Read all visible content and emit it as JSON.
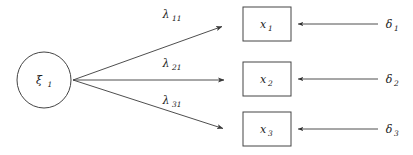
{
  "diagram": {
    "type": "sem-path-diagram",
    "background_color": "#ffffff",
    "stroke_color": "#3a3a3a",
    "text_color": "#1a1a1a",
    "latent_variables": [
      {
        "id": "xi1",
        "symbol": "ξ",
        "subscript": "1",
        "shape": "ellipse",
        "cx": 44,
        "cy": 80,
        "rx": 27,
        "ry": 28
      }
    ],
    "observed_variables": [
      {
        "id": "x1",
        "symbol": "x",
        "subscript": "1",
        "shape": "rectangle",
        "x": 243,
        "y": 7,
        "width": 48,
        "height": 34
      },
      {
        "id": "x2",
        "symbol": "x",
        "subscript": "2",
        "shape": "rectangle",
        "x": 243,
        "y": 62,
        "width": 48,
        "height": 34
      },
      {
        "id": "x3",
        "symbol": "x",
        "subscript": "3",
        "shape": "rectangle",
        "x": 243,
        "y": 112,
        "width": 48,
        "height": 34
      }
    ],
    "error_terms": [
      {
        "id": "delta1",
        "symbol": "δ",
        "subscript": "1",
        "x": 388,
        "y": 24
      },
      {
        "id": "delta2",
        "symbol": "δ",
        "subscript": "2",
        "x": 388,
        "y": 79
      },
      {
        "id": "delta3",
        "symbol": "δ",
        "subscript": "3",
        "x": 388,
        "y": 129
      }
    ],
    "loading_paths": [
      {
        "id": "lambda11",
        "symbol": "λ",
        "subscript": "11",
        "from": "xi1",
        "to": "x1",
        "x1": 73,
        "y1": 80,
        "x2": 226,
        "y2": 25,
        "label_x": 166,
        "label_y": 18
      },
      {
        "id": "lambda21",
        "symbol": "λ",
        "subscript": "21",
        "from": "xi1",
        "to": "x2",
        "x1": 73,
        "y1": 80,
        "x2": 228,
        "y2": 80,
        "label_x": 166,
        "label_y": 67
      },
      {
        "id": "lambda31",
        "symbol": "λ",
        "subscript": "31",
        "from": "xi1",
        "to": "x3",
        "x1": 73,
        "y1": 80,
        "x2": 227,
        "y2": 130,
        "label_x": 166,
        "label_y": 104
      }
    ],
    "error_paths": [
      {
        "id": "delta1-to-x1",
        "from": "delta1",
        "to": "x1",
        "x1": 378,
        "y1": 24,
        "x2": 295,
        "y2": 24
      },
      {
        "id": "delta2-to-x2",
        "from": "delta2",
        "to": "x2",
        "x1": 378,
        "y1": 79,
        "x2": 295,
        "y2": 79
      },
      {
        "id": "delta3-to-x3",
        "from": "delta3",
        "to": "x3",
        "x1": 378,
        "y1": 129,
        "x2": 295,
        "y2": 129
      }
    ]
  }
}
